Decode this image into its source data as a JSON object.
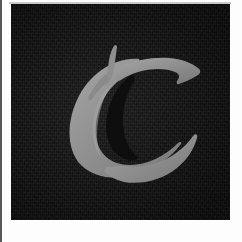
{
  "image": {
    "kind": "letter-tile",
    "width": 242,
    "height": 242,
    "description": "Dark textured square plate bearing a large gray blackletter capital C"
  },
  "plate": {
    "background_color": "#0d0d0d",
    "surround_color": "#fdfdfd",
    "edge_rule_color": "#3b3b3b",
    "top_rule_color": "#c9c9c9",
    "left": 11,
    "top": 4,
    "width": 219,
    "height": 216
  },
  "glyph": {
    "character": "C",
    "name": "blackletter-capital-c",
    "style": "Old English / Fraktur blackletter",
    "fill_color": "#8f8f8f",
    "highlight_color": "#a3a3a3",
    "shadow_color": "#6f6f6f",
    "bounding_box": {
      "x": 69,
      "y": 53,
      "width": 101,
      "height": 115
    }
  }
}
